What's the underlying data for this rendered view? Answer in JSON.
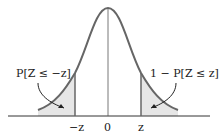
{
  "diagram": {
    "type": "normal-distribution-tails",
    "left_label": "P[Z ≤ −z]",
    "right_label": "1 − P[Z ≤ z]",
    "ticks": {
      "neg_z": "−z",
      "zero": "0",
      "pos_z": "z"
    },
    "colors": {
      "curve": "#666666",
      "shade": "#e6e6e6",
      "axis": "#333333"
    }
  }
}
